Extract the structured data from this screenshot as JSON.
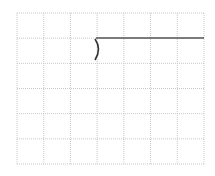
{
  "grid": {
    "left": 17,
    "top": 13,
    "right": 204,
    "bottom": 164,
    "columns": 7,
    "rows": 6,
    "line_color": "#c8c8c8"
  },
  "segment": {
    "x1": 96,
    "y1": 38,
    "x2": 204,
    "y2": 38,
    "color": "#555555"
  },
  "bracket": {
    "symbol": ")",
    "x": 96,
    "y": 38,
    "height": 22,
    "color": "#333333"
  }
}
